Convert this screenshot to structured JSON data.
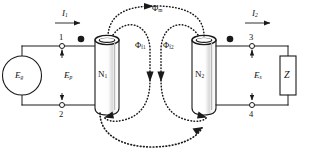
{
  "figure": {
    "type": "circuit-diagram",
    "background_color": "#ffffff",
    "line_color": "#1a1a1a",
    "flux_color": "#1a1a1a"
  },
  "source": {
    "symbol_name": "ac-generator",
    "label": "E",
    "subscript": "g"
  },
  "primary": {
    "terminal_top": "1",
    "terminal_bottom": "2",
    "voltage_label": "E",
    "voltage_subscript": "p",
    "current_label": "I",
    "current_subscript": "1",
    "coil_label": "N",
    "coil_subscript": "1",
    "polarity_dot": "dot"
  },
  "secondary": {
    "terminal_top": "3",
    "terminal_bottom": "4",
    "voltage_label": "E",
    "voltage_subscript": "s",
    "current_label": "I",
    "current_subscript": "2",
    "coil_label": "N",
    "coil_subscript": "2",
    "polarity_dot": "dot"
  },
  "load": {
    "symbol_name": "impedance-box",
    "label": "Z"
  },
  "flux": {
    "mutual": {
      "label": "Φ",
      "subscript": "m"
    },
    "leakage_primary": {
      "label": "Φ",
      "subscript": "f1"
    },
    "leakage_secondary": {
      "label": "Φ",
      "subscript": "f2"
    }
  }
}
